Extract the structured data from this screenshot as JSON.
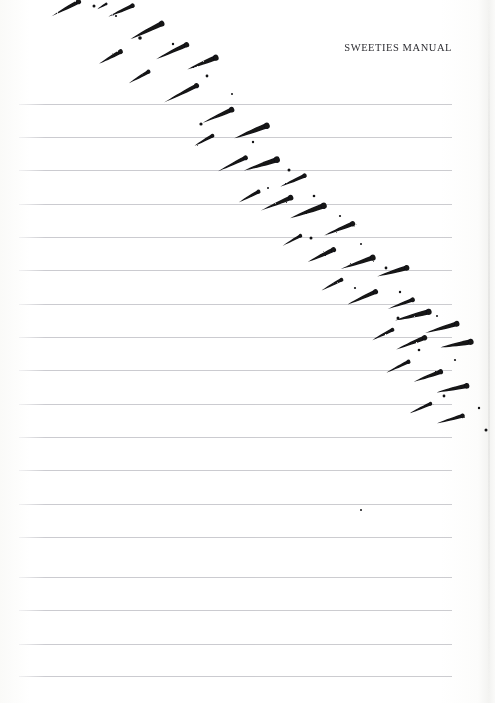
{
  "page": {
    "width": 495,
    "height": 703,
    "background_color": "#fefefe",
    "paper_type": "ruled notebook page (scan)"
  },
  "header": {
    "title": "SWEETIES MANUAL",
    "align": "right",
    "color": "#2e2e33"
  },
  "rules": {
    "color": "#c9c9ce",
    "thickness_px": 1,
    "x_start": 19,
    "x_end": 452,
    "spacing_px": 33.3,
    "count": 18,
    "y_positions": [
      104,
      137,
      170,
      204,
      237,
      270,
      304,
      337,
      370,
      404,
      437,
      470,
      504,
      537,
      577,
      610,
      644,
      676
    ]
  },
  "ink": {
    "color": "#121214",
    "description": "diagonal band of tapered brush strokes with speckles",
    "band_start": [
      65,
      0
    ],
    "band_end": [
      490,
      440
    ],
    "stroke_angle_deg": 63,
    "strokes": [
      {
        "x": 78,
        "y": 2,
        "len": 30,
        "w": 4.4,
        "rot": 62
      },
      {
        "x": 132,
        "y": 6,
        "len": 26,
        "w": 4.0,
        "rot": 66
      },
      {
        "x": 106,
        "y": 4,
        "len": 10,
        "w": 2.2,
        "rot": 60
      },
      {
        "x": 161,
        "y": 24,
        "len": 34,
        "w": 5.0,
        "rot": 64
      },
      {
        "x": 120,
        "y": 52,
        "len": 24,
        "w": 4.2,
        "rot": 61
      },
      {
        "x": 186,
        "y": 45,
        "len": 33,
        "w": 4.6,
        "rot": 65
      },
      {
        "x": 215,
        "y": 58,
        "len": 30,
        "w": 5.2,
        "rot": 68
      },
      {
        "x": 148,
        "y": 72,
        "len": 22,
        "w": 3.6,
        "rot": 60
      },
      {
        "x": 196,
        "y": 86,
        "len": 36,
        "w": 4.4,
        "rot": 63
      },
      {
        "x": 231,
        "y": 110,
        "len": 31,
        "w": 4.8,
        "rot": 66
      },
      {
        "x": 266,
        "y": 126,
        "len": 34,
        "w": 5.4,
        "rot": 69
      },
      {
        "x": 212,
        "y": 136,
        "len": 20,
        "w": 3.4,
        "rot": 61
      },
      {
        "x": 245,
        "y": 158,
        "len": 30,
        "w": 4.2,
        "rot": 64
      },
      {
        "x": 276,
        "y": 160,
        "len": 34,
        "w": 5.6,
        "rot": 72
      },
      {
        "x": 304,
        "y": 176,
        "len": 26,
        "w": 4.0,
        "rot": 66
      },
      {
        "x": 258,
        "y": 192,
        "len": 22,
        "w": 3.6,
        "rot": 62
      },
      {
        "x": 290,
        "y": 198,
        "len": 32,
        "w": 4.8,
        "rot": 67
      },
      {
        "x": 323,
        "y": 206,
        "len": 35,
        "w": 5.4,
        "rot": 70
      },
      {
        "x": 352,
        "y": 224,
        "len": 30,
        "w": 4.6,
        "rot": 68
      },
      {
        "x": 300,
        "y": 236,
        "len": 20,
        "w": 3.2,
        "rot": 61
      },
      {
        "x": 333,
        "y": 250,
        "len": 28,
        "w": 4.4,
        "rot": 65
      },
      {
        "x": 372,
        "y": 258,
        "len": 33,
        "w": 5.2,
        "rot": 71
      },
      {
        "x": 406,
        "y": 268,
        "len": 30,
        "w": 4.8,
        "rot": 74
      },
      {
        "x": 341,
        "y": 280,
        "len": 22,
        "w": 3.4,
        "rot": 62
      },
      {
        "x": 375,
        "y": 292,
        "len": 30,
        "w": 4.4,
        "rot": 66
      },
      {
        "x": 412,
        "y": 300,
        "len": 26,
        "w": 4.2,
        "rot": 70
      },
      {
        "x": 428,
        "y": 312,
        "len": 34,
        "w": 5.2,
        "rot": 76
      },
      {
        "x": 392,
        "y": 330,
        "len": 22,
        "w": 3.4,
        "rot": 63
      },
      {
        "x": 424,
        "y": 338,
        "len": 30,
        "w": 4.6,
        "rot": 68
      },
      {
        "x": 456,
        "y": 324,
        "len": 32,
        "w": 5.0,
        "rot": 74
      },
      {
        "x": 470,
        "y": 342,
        "len": 30,
        "w": 5.2,
        "rot": 80
      },
      {
        "x": 408,
        "y": 362,
        "len": 24,
        "w": 3.6,
        "rot": 64
      },
      {
        "x": 440,
        "y": 372,
        "len": 28,
        "w": 4.4,
        "rot": 70
      },
      {
        "x": 466,
        "y": 386,
        "len": 30,
        "w": 4.8,
        "rot": 78
      },
      {
        "x": 430,
        "y": 404,
        "len": 22,
        "w": 3.2,
        "rot": 66
      },
      {
        "x": 462,
        "y": 416,
        "len": 26,
        "w": 4.0,
        "rot": 74
      }
    ],
    "specks": [
      {
        "x": 94,
        "y": 6,
        "r": 1.5
      },
      {
        "x": 116,
        "y": 16,
        "r": 1.1
      },
      {
        "x": 140,
        "y": 38,
        "r": 1.8
      },
      {
        "x": 173,
        "y": 44,
        "r": 1.2
      },
      {
        "x": 207,
        "y": 76,
        "r": 1.4
      },
      {
        "x": 232,
        "y": 94,
        "r": 1.0
      },
      {
        "x": 201,
        "y": 124,
        "r": 1.6
      },
      {
        "x": 253,
        "y": 142,
        "r": 1.2
      },
      {
        "x": 289,
        "y": 170,
        "r": 1.5
      },
      {
        "x": 268,
        "y": 188,
        "r": 1.0
      },
      {
        "x": 314,
        "y": 196,
        "r": 1.3
      },
      {
        "x": 340,
        "y": 216,
        "r": 1.1
      },
      {
        "x": 311,
        "y": 238,
        "r": 1.5
      },
      {
        "x": 361,
        "y": 244,
        "r": 1.0
      },
      {
        "x": 386,
        "y": 268,
        "r": 1.4
      },
      {
        "x": 355,
        "y": 288,
        "r": 1.1
      },
      {
        "x": 400,
        "y": 292,
        "r": 1.2
      },
      {
        "x": 398,
        "y": 318,
        "r": 1.5
      },
      {
        "x": 437,
        "y": 316,
        "r": 1.0
      },
      {
        "x": 419,
        "y": 350,
        "r": 1.3
      },
      {
        "x": 455,
        "y": 360,
        "r": 1.1
      },
      {
        "x": 444,
        "y": 396,
        "r": 1.4
      },
      {
        "x": 479,
        "y": 408,
        "r": 1.2
      },
      {
        "x": 486,
        "y": 430,
        "r": 1.5
      },
      {
        "x": 361,
        "y": 510,
        "r": 1.0
      }
    ]
  }
}
